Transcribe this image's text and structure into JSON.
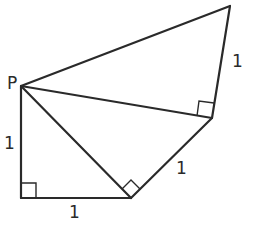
{
  "diagram": {
    "type": "geometry-figure",
    "colors": {
      "stroke": "#2a2a2a",
      "background": "#ffffff"
    },
    "points": {
      "P": [
        21,
        86
      ],
      "A": [
        21,
        198
      ],
      "B": [
        131,
        198
      ],
      "C": [
        212,
        118
      ],
      "D": [
        230,
        6
      ]
    },
    "labels": {
      "point_p": "P",
      "side_pa": "1",
      "side_ab": "1",
      "side_bc": "1",
      "side_cd": "1"
    },
    "segments": [
      {
        "from": "P",
        "to": "A"
      },
      {
        "from": "A",
        "to": "B"
      },
      {
        "from": "P",
        "to": "B"
      },
      {
        "from": "B",
        "to": "C"
      },
      {
        "from": "P",
        "to": "C"
      },
      {
        "from": "C",
        "to": "D"
      },
      {
        "from": "P",
        "to": "D"
      }
    ],
    "right_angles": [
      "A",
      "B",
      "C"
    ]
  }
}
